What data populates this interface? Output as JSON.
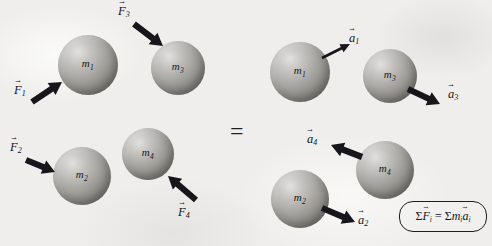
{
  "figure": {
    "type": "physics-free-body-diagram",
    "background_color": "#efeeec",
    "equals_sign": "=",
    "equation_box": {
      "sum_symbol": "Σ",
      "force_vector": "F",
      "force_index": "i",
      "equals": "=",
      "mass_symbol": "m",
      "mass_index": "i",
      "accel_vector": "a",
      "accel_index": "i",
      "full_text": "ΣFᵢ = Σmᵢaᵢ"
    }
  },
  "left_panel": {
    "caption": "forces acting on the system",
    "bodies": [
      {
        "name": "mass-1",
        "mass_symbol": "m",
        "mass_index": "1",
        "cx": 88,
        "cy": 65,
        "r": 30
      },
      {
        "name": "mass-3",
        "mass_symbol": "m",
        "mass_index": "3",
        "cx": 178,
        "cy": 68,
        "r": 27
      },
      {
        "name": "mass-2",
        "mass_symbol": "m",
        "mass_index": "2",
        "cx": 82,
        "cy": 176,
        "r": 29
      },
      {
        "name": "mass-4",
        "mass_symbol": "m",
        "mass_index": "4",
        "cx": 148,
        "cy": 154,
        "r": 26
      }
    ],
    "vectors": [
      {
        "name": "force-1",
        "symbol": "F",
        "index": "1",
        "label_x": 14,
        "label_y": 84,
        "x1": 32,
        "y1": 102,
        "x2": 62,
        "y2": 82,
        "style": "thick"
      },
      {
        "name": "force-3",
        "symbol": "F",
        "index": "3",
        "label_x": 118,
        "label_y": 5,
        "x1": 134,
        "y1": 24,
        "x2": 163,
        "y2": 46,
        "style": "thick"
      },
      {
        "name": "force-2",
        "symbol": "F",
        "index": "2",
        "label_x": 10,
        "label_y": 141,
        "x1": 26,
        "y1": 160,
        "x2": 55,
        "y2": 172,
        "style": "thick"
      },
      {
        "name": "force-4",
        "symbol": "F",
        "index": "4",
        "label_x": 178,
        "label_y": 206,
        "x1": 196,
        "y1": 200,
        "x2": 168,
        "y2": 176,
        "style": "thick"
      }
    ]
  },
  "right_panel": {
    "caption": "resulting accelerations of the system",
    "bodies": [
      {
        "name": "mass-1",
        "mass_symbol": "m",
        "mass_index": "1",
        "cx": 300,
        "cy": 72,
        "r": 30
      },
      {
        "name": "mass-3",
        "mass_symbol": "m",
        "mass_index": "3",
        "cx": 390,
        "cy": 76,
        "r": 27
      },
      {
        "name": "mass-4",
        "mass_symbol": "m",
        "mass_index": "4",
        "cx": 385,
        "cy": 170,
        "r": 29
      },
      {
        "name": "mass-2",
        "mass_symbol": "m",
        "mass_index": "2",
        "cx": 300,
        "cy": 199,
        "r": 29
      }
    ],
    "vectors": [
      {
        "name": "acceleration-1",
        "symbol": "a",
        "index": "1",
        "label_x": 349,
        "label_y": 32,
        "x1": 322,
        "y1": 58,
        "x2": 350,
        "y2": 44,
        "style": "thin"
      },
      {
        "name": "acceleration-3",
        "symbol": "a",
        "index": "3",
        "label_x": 448,
        "label_y": 88,
        "x1": 408,
        "y1": 89,
        "x2": 440,
        "y2": 104,
        "style": "thick"
      },
      {
        "name": "acceleration-4",
        "symbol": "a",
        "index": "4",
        "label_x": 307,
        "label_y": 133,
        "x1": 362,
        "y1": 157,
        "x2": 331,
        "y2": 145,
        "style": "thick"
      },
      {
        "name": "acceleration-2",
        "symbol": "a",
        "index": "2",
        "label_x": 358,
        "label_y": 214,
        "x1": 322,
        "y1": 208,
        "x2": 355,
        "y2": 222,
        "style": "thick"
      }
    ]
  }
}
